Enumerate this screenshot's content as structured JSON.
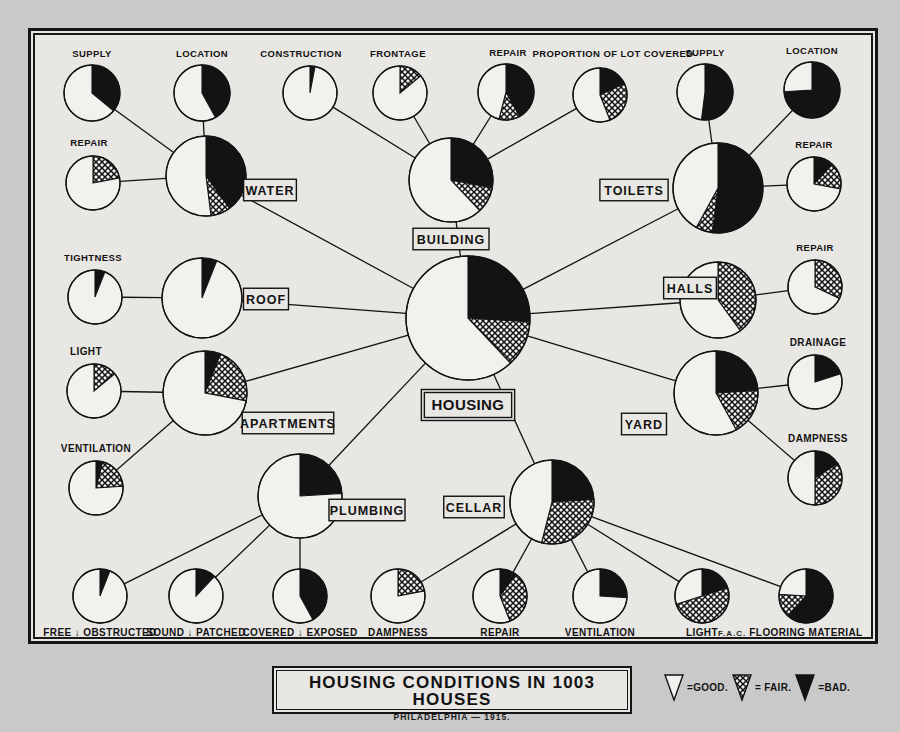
{
  "title": {
    "main": "HOUSING CONDITIONS IN 1003 HOUSES",
    "sub": "PHILADELPHIA — 1915.",
    "signature": "F.A.C."
  },
  "legend": {
    "good_label": "=GOOD.",
    "fair_label": "= FAIR.",
    "bad_label": "=BAD.",
    "good_swatch": "good-wedge-icon",
    "fair_swatch": "fair-wedge-icon",
    "bad_swatch": "bad-wedge-icon",
    "colors": {
      "good": "#f3f1ee",
      "fair": "#8a8a8a",
      "bad": "#131313",
      "ink": "#131313"
    }
  },
  "chart_data": {
    "type": "pie",
    "title": "HOUSING CONDITIONS IN 1003 HOUSES",
    "subtitle": "PHILADELPHIA — 1915.",
    "categories": [
      "GOOD",
      "FAIR",
      "BAD"
    ],
    "legend_position": "bottom-right",
    "units": "percent of 1003 houses",
    "root": {
      "id": "housing",
      "label": "HOUSING",
      "cx": 468,
      "cy": 318,
      "r": 62,
      "values": {
        "good": 62,
        "fair": 12,
        "bad": 26
      }
    },
    "hubs": [
      {
        "id": "water",
        "label": "WATER",
        "cx": 206,
        "cy": 176,
        "r": 40,
        "values": {
          "good": 52,
          "fair": 8,
          "bad": 40
        }
      },
      {
        "id": "building",
        "label": "BUILDING",
        "cx": 451,
        "cy": 180,
        "r": 42,
        "values": {
          "good": 62,
          "fair": 10,
          "bad": 28
        }
      },
      {
        "id": "toilets",
        "label": "TOILETS",
        "cx": 718,
        "cy": 188,
        "r": 45,
        "values": {
          "good": 42,
          "fair": 6,
          "bad": 52
        }
      },
      {
        "id": "roof",
        "label": "ROOF",
        "cx": 202,
        "cy": 298,
        "r": 40,
        "values": {
          "good": 94,
          "fair": 0,
          "bad": 6
        }
      },
      {
        "id": "halls",
        "label": "HALLS",
        "cx": 718,
        "cy": 300,
        "r": 38,
        "values": {
          "good": 60,
          "fair": 40,
          "bad": 0
        }
      },
      {
        "id": "apartments",
        "label": "APARTMENTS",
        "cx": 205,
        "cy": 393,
        "r": 42,
        "values": {
          "good": 72,
          "fair": 22,
          "bad": 6
        }
      },
      {
        "id": "yard",
        "label": "YARD",
        "cx": 716,
        "cy": 393,
        "r": 42,
        "values": {
          "good": 58,
          "fair": 18,
          "bad": 24
        }
      },
      {
        "id": "plumbing",
        "label": "PLUMBING",
        "cx": 300,
        "cy": 496,
        "r": 42,
        "values": {
          "good": 76,
          "fair": 0,
          "bad": 24
        }
      },
      {
        "id": "cellar",
        "label": "CELLAR",
        "cx": 552,
        "cy": 502,
        "r": 42,
        "values": {
          "good": 46,
          "fair": 30,
          "bad": 24
        }
      }
    ],
    "leaves": [
      {
        "id": "water-supply",
        "label": "SUPPLY",
        "parent": "water",
        "cx": 92,
        "cy": 93,
        "r": 28,
        "label_x": 92,
        "label_y": 57,
        "values": {
          "good": 64,
          "fair": 0,
          "bad": 36
        }
      },
      {
        "id": "water-location",
        "label": "LOCATION",
        "parent": "water",
        "cx": 202,
        "cy": 93,
        "r": 28,
        "label_x": 202,
        "label_y": 57,
        "values": {
          "good": 58,
          "fair": 0,
          "bad": 42
        }
      },
      {
        "id": "water-repair",
        "label": "REPAIR",
        "parent": "water",
        "cx": 93,
        "cy": 183,
        "r": 27,
        "label_x": 89,
        "label_y": 146,
        "values": {
          "good": 78,
          "fair": 22,
          "bad": 0
        }
      },
      {
        "id": "building-construction",
        "label": "CONSTRUCTION",
        "parent": "building",
        "cx": 310,
        "cy": 93,
        "r": 27,
        "label_x": 301,
        "label_y": 57,
        "values": {
          "good": 97,
          "fair": 0,
          "bad": 3
        }
      },
      {
        "id": "building-frontage",
        "label": "FRONTAGE",
        "parent": "building",
        "cx": 400,
        "cy": 93,
        "r": 27,
        "label_x": 398,
        "label_y": 57,
        "values": {
          "good": 86,
          "fair": 14,
          "bad": 0
        }
      },
      {
        "id": "building-repair",
        "label": "REPAIR",
        "parent": "building",
        "cx": 506,
        "cy": 92,
        "r": 28,
        "label_x": 508,
        "label_y": 56,
        "values": {
          "good": 46,
          "fair": 12,
          "bad": 42
        }
      },
      {
        "id": "building-lot",
        "label": "PROPORTION OF LOT COVERED",
        "parent": "building",
        "cx": 600,
        "cy": 95,
        "r": 27,
        "label_x": 613,
        "label_y": 57,
        "values": {
          "good": 56,
          "fair": 26,
          "bad": 18
        }
      },
      {
        "id": "toilets-supply",
        "label": "SUPPLY",
        "parent": "toilets",
        "cx": 705,
        "cy": 92,
        "r": 28,
        "label_x": 705,
        "label_y": 56,
        "values": {
          "good": 48,
          "fair": 0,
          "bad": 52
        }
      },
      {
        "id": "toilets-location",
        "label": "LOCATION",
        "parent": "toilets",
        "cx": 812,
        "cy": 90,
        "r": 28,
        "label_x": 812,
        "label_y": 54,
        "values": {
          "good": 26,
          "fair": 0,
          "bad": 74
        }
      },
      {
        "id": "toilets-repair",
        "label": "REPAIR",
        "parent": "toilets",
        "cx": 814,
        "cy": 184,
        "r": 27,
        "label_x": 814,
        "label_y": 148,
        "values": {
          "good": 72,
          "fair": 16,
          "bad": 12
        }
      },
      {
        "id": "roof-tightness",
        "label": "TIGHTNESS",
        "parent": "roof",
        "cx": 95,
        "cy": 297,
        "r": 27,
        "label_x": 93,
        "label_y": 261,
        "values": {
          "good": 94,
          "fair": 0,
          "bad": 6
        }
      },
      {
        "id": "halls-repair",
        "label": "REPAIR",
        "parent": "halls",
        "cx": 815,
        "cy": 287,
        "r": 27,
        "label_x": 815,
        "label_y": 251,
        "values": {
          "good": 68,
          "fair": 32,
          "bad": 0
        }
      },
      {
        "id": "apartments-light",
        "label": "LIGHT",
        "parent": "apartments",
        "cx": 94,
        "cy": 391,
        "r": 27,
        "label_x": 86,
        "label_y": 355,
        "values": {
          "good": 86,
          "fair": 14,
          "bad": 0
        }
      },
      {
        "id": "apartments-ventilation",
        "label": "VENTILATION",
        "parent": "apartments",
        "cx": 96,
        "cy": 488,
        "r": 27,
        "label_x": 96,
        "label_y": 452,
        "values": {
          "good": 76,
          "fair": 20,
          "bad": 4
        }
      },
      {
        "id": "yard-drainage",
        "label": "DRAINAGE",
        "parent": "yard",
        "cx": 815,
        "cy": 382,
        "r": 27,
        "label_x": 818,
        "label_y": 346,
        "values": {
          "good": 80,
          "fair": 0,
          "bad": 20
        }
      },
      {
        "id": "yard-dampness",
        "label": "DAMPNESS",
        "parent": "yard",
        "cx": 815,
        "cy": 478,
        "r": 27,
        "label_x": 818,
        "label_y": 442,
        "values": {
          "good": 50,
          "fair": 34,
          "bad": 16
        }
      },
      {
        "id": "plumbing-free",
        "label": "FREE ↓ OBSTRUCTED",
        "parent": "plumbing",
        "cx": 100,
        "cy": 596,
        "r": 27,
        "label_x": 100,
        "label_y": 636,
        "values": {
          "good": 94,
          "fair": 0,
          "bad": 6
        }
      },
      {
        "id": "plumbing-sound",
        "label": "SOUND ↓ PATCHED",
        "parent": "plumbing",
        "cx": 196,
        "cy": 596,
        "r": 27,
        "label_x": 196,
        "label_y": 636,
        "values": {
          "good": 88,
          "fair": 0,
          "bad": 12
        }
      },
      {
        "id": "plumbing-covered",
        "label": "COVERED ↓ EXPOSED",
        "parent": "plumbing",
        "cx": 300,
        "cy": 596,
        "r": 27,
        "label_x": 300,
        "label_y": 636,
        "values": {
          "good": 58,
          "fair": 0,
          "bad": 42
        }
      },
      {
        "id": "cellar-dampness",
        "label": "DAMPNESS",
        "parent": "cellar",
        "cx": 398,
        "cy": 596,
        "r": 27,
        "label_x": 398,
        "label_y": 636,
        "values": {
          "good": 78,
          "fair": 22,
          "bad": 0
        }
      },
      {
        "id": "cellar-repair",
        "label": "REPAIR",
        "parent": "cellar",
        "cx": 500,
        "cy": 596,
        "r": 27,
        "label_x": 500,
        "label_y": 636,
        "values": {
          "good": 56,
          "fair": 34,
          "bad": 10
        }
      },
      {
        "id": "cellar-ventilation",
        "label": "VENTILATION",
        "parent": "cellar",
        "cx": 600,
        "cy": 596,
        "r": 27,
        "label_x": 600,
        "label_y": 636,
        "values": {
          "good": 74,
          "fair": 0,
          "bad": 26
        }
      },
      {
        "id": "cellar-light",
        "label": "LIGHT",
        "parent": "cellar",
        "cx": 702,
        "cy": 596,
        "r": 27,
        "label_x": 702,
        "label_y": 636,
        "values": {
          "good": 30,
          "fair": 50,
          "bad": 20
        }
      },
      {
        "id": "cellar-flooring",
        "label": "FLOORING MATERIAL",
        "parent": "cellar",
        "cx": 806,
        "cy": 596,
        "r": 27,
        "label_x": 806,
        "label_y": 636,
        "values": {
          "good": 24,
          "fair": 14,
          "bad": 62
        }
      }
    ]
  }
}
